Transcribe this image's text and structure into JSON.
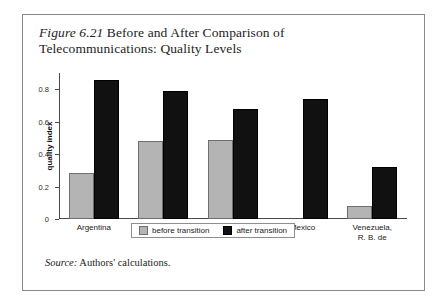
{
  "figure": {
    "label": "Figure 6.21",
    "title_text": "Before and After Comparison of Telecommunications: Quality Levels",
    "source_label": "Source:",
    "source_text": "Authors' calculations."
  },
  "chart_data": {
    "type": "bar",
    "title": "Figure 6.21 Before and After Comparison of Telecommunications: Quality Levels",
    "xlabel": "",
    "ylabel": "quality index",
    "ylim": [
      0,
      0.9
    ],
    "yticks": [
      0,
      0.2,
      0.4,
      0.6,
      0.8
    ],
    "ytick_labels": [
      "0",
      "0.2",
      "0.4",
      "0.6",
      "0.8"
    ],
    "grid": false,
    "legend_position": "bottom-center",
    "categories": [
      "Argentina",
      "Brazil",
      "Chile",
      "Mexico",
      "Venezuela, R. B. de"
    ],
    "category_lines": [
      [
        "Argentina"
      ],
      [
        "Brazil"
      ],
      [
        "Chile"
      ],
      [
        "Mexico"
      ],
      [
        "Venezuela,",
        "R. B. de"
      ]
    ],
    "series": [
      {
        "name": "before transition",
        "color": "#b4b4b4",
        "values": [
          0.285,
          0.48,
          0.49,
          0.0,
          0.08
        ]
      },
      {
        "name": "after transition",
        "color": "#111111",
        "values": [
          0.86,
          0.79,
          0.68,
          0.74,
          0.32
        ]
      }
    ]
  }
}
